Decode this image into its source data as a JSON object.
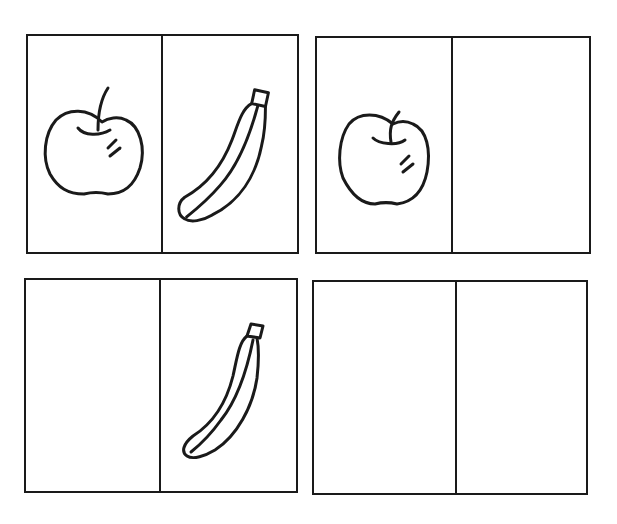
{
  "worksheet": {
    "cards": [
      {
        "id": "top-left",
        "cells": [
          {
            "item": "apple"
          },
          {
            "item": "banana"
          }
        ]
      },
      {
        "id": "top-right",
        "cells": [
          {
            "item": "apple"
          },
          {
            "item": ""
          }
        ]
      },
      {
        "id": "bottom-left",
        "cells": [
          {
            "item": ""
          },
          {
            "item": "banana"
          }
        ]
      },
      {
        "id": "bottom-right",
        "cells": [
          {
            "item": ""
          },
          {
            "item": ""
          }
        ]
      }
    ],
    "icons": {
      "apple": "apple-icon",
      "banana": "banana-icon"
    },
    "colors": {
      "ink": "#1a1a1a",
      "paper": "#ffffff"
    }
  }
}
